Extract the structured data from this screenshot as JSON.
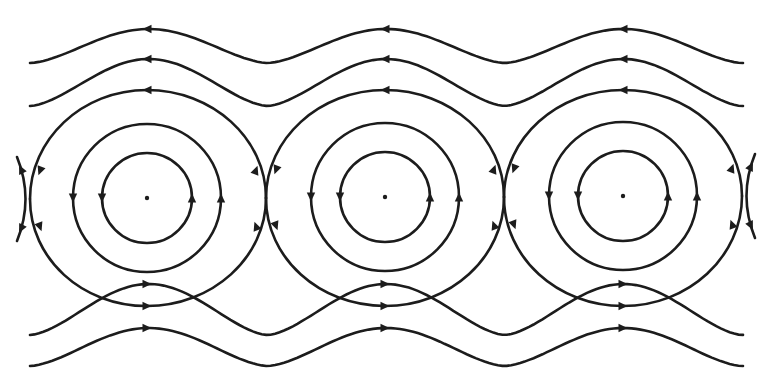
{
  "diagram": {
    "title": "",
    "type": "phase-portrait",
    "colors": {
      "ink": "#1c1c1c",
      "background": "#ffffff"
    },
    "centers": [
      {
        "x": 147,
        "y": 198
      },
      {
        "x": 385,
        "y": 197
      },
      {
        "x": 623,
        "y": 196
      }
    ],
    "saddles": [
      {
        "x": 30,
        "y": 199
      },
      {
        "x": 266,
        "y": 198
      },
      {
        "x": 504,
        "y": 197
      },
      {
        "x": 742,
        "y": 196
      }
    ],
    "closed_orbit_radii": [
      45,
      74
    ],
    "closed_orbit_direction": "clockwise (up on right, down on left)",
    "separatrix": {
      "top_y": 90,
      "bottom_y": 306,
      "top_flow": "leftward",
      "bottom_flow": "rightward"
    },
    "upper_open_streamlines": [
      {
        "peak_y": 29,
        "trough_y": 63,
        "flow": "leftward"
      },
      {
        "peak_y": 59,
        "trough_y": 106,
        "flow": "leftward"
      }
    ],
    "lower_open_streamlines": [
      {
        "peak_y": 284,
        "trough_y": 335,
        "flow": "rightward"
      },
      {
        "peak_y": 328,
        "trough_y": 366,
        "flow": "rightward"
      }
    ],
    "x_range": [
      30,
      743
    ]
  }
}
